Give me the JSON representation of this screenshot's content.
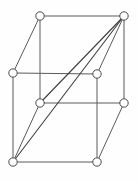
{
  "figure": {
    "width": 139,
    "height": 181,
    "background_color": "#fefefe",
    "edge_color": "#5a5a5a",
    "diagonal_color": "#3f3f3f",
    "vertex_fill_color": "#ffffff",
    "vertex_stroke_color": "#4a4a4a",
    "vertex_radius": 4.2
  },
  "chart_data": {
    "type": "diagram",
    "layout": "oblique-projection",
    "node_count": 8,
    "edge_count": 14,
    "nodes": [
      {
        "id": "back-top-left",
        "label": "",
        "x": 40,
        "y": 16
      },
      {
        "id": "back-top-right",
        "label": "",
        "x": 124,
        "y": 16
      },
      {
        "id": "front-top-left",
        "label": "",
        "x": 13,
        "y": 73
      },
      {
        "id": "front-top-right",
        "label": "",
        "x": 97,
        "y": 74
      },
      {
        "id": "back-bottom-left",
        "label": "",
        "x": 40,
        "y": 103
      },
      {
        "id": "back-bottom-right",
        "label": "",
        "x": 124,
        "y": 103
      },
      {
        "id": "front-bottom-left",
        "label": "",
        "x": 13,
        "y": 162
      },
      {
        "id": "front-bottom-right",
        "label": "",
        "x": 97,
        "y": 162
      }
    ],
    "edges": [
      {
        "id": "e-back-top",
        "from": "back-top-left",
        "to": "back-top-right",
        "kind": "cube"
      },
      {
        "id": "e-back-left",
        "from": "back-top-left",
        "to": "back-bottom-left",
        "kind": "cube"
      },
      {
        "id": "e-back-right",
        "from": "back-top-right",
        "to": "back-bottom-right",
        "kind": "cube"
      },
      {
        "id": "e-back-bottom",
        "from": "back-bottom-left",
        "to": "back-bottom-right",
        "kind": "cube"
      },
      {
        "id": "e-front-top",
        "from": "front-top-left",
        "to": "front-top-right",
        "kind": "cube"
      },
      {
        "id": "e-front-left",
        "from": "front-top-left",
        "to": "front-bottom-left",
        "kind": "cube"
      },
      {
        "id": "e-front-right",
        "from": "front-top-right",
        "to": "front-bottom-right",
        "kind": "cube"
      },
      {
        "id": "e-front-bottom",
        "from": "front-bottom-left",
        "to": "front-bottom-right",
        "kind": "cube"
      },
      {
        "id": "e-depth-top-left",
        "from": "back-top-left",
        "to": "front-top-left",
        "kind": "cube"
      },
      {
        "id": "e-depth-top-right",
        "from": "back-top-right",
        "to": "front-top-right",
        "kind": "cube"
      },
      {
        "id": "e-depth-bottom-left",
        "from": "back-bottom-left",
        "to": "front-bottom-left",
        "kind": "cube"
      },
      {
        "id": "e-depth-bottom-right",
        "from": "back-bottom-right",
        "to": "front-bottom-right",
        "kind": "cube"
      },
      {
        "id": "e-diagonal-long",
        "from": "front-bottom-left",
        "to": "back-top-right",
        "kind": "diagonal"
      },
      {
        "id": "e-diagonal-short",
        "from": "back-bottom-left",
        "to": "back-top-right",
        "kind": "diagonal"
      }
    ]
  }
}
